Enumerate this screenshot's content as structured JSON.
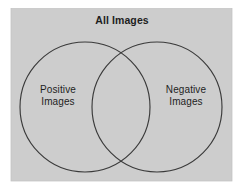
{
  "figure": {
    "type": "venn-diagram",
    "universe_label": "All Images",
    "background_color": "#ffffff",
    "universe_fill": "#cdcdcd",
    "stroke_color": "#3a3a3a",
    "text_color": "#1e1e1e",
    "sets": [
      {
        "id": "positive",
        "label": "Positive\nImages",
        "label_line1": "Positive",
        "label_line2": "Images"
      },
      {
        "id": "negative",
        "label": "Negative\nImages",
        "label_line1": "Negative",
        "label_line2": "Images"
      }
    ]
  }
}
